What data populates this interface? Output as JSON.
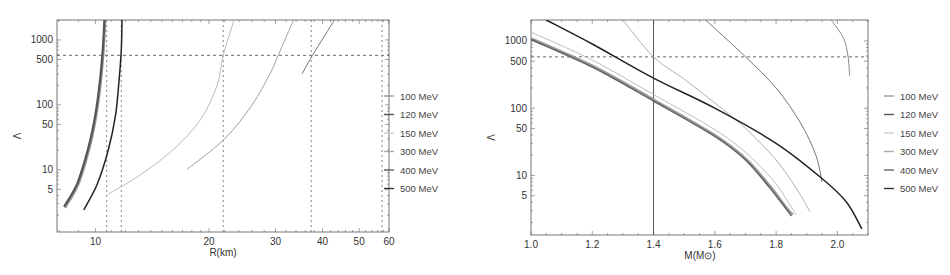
{
  "chart_data": [
    {
      "type": "line",
      "title": "",
      "xlabel": "R(km)",
      "ylabel": "Λ",
      "xscale": "log",
      "yscale": "log",
      "xlim": [
        7.9,
        60
      ],
      "ylim": [
        1.1,
        2030
      ],
      "xticks": [
        10,
        20,
        30,
        40,
        50,
        60
      ],
      "yticks": [
        5,
        10,
        50,
        100,
        500,
        1000
      ],
      "grid": false,
      "legend_position": "right",
      "reference_lines": {
        "horizontal": [
          {
            "y": 580,
            "style": "dashed"
          }
        ],
        "vertical": [
          {
            "x": 10.7,
            "style": "dotted"
          },
          {
            "x": 11.7,
            "style": "dotted"
          },
          {
            "x": 21.8,
            "style": "dotted"
          },
          {
            "x": 37.3,
            "style": "dotted"
          },
          {
            "x": 57.5,
            "style": "dotted"
          }
        ]
      },
      "series": [
        {
          "name": "100 MeV",
          "color": "#9a9a9a",
          "width": 2.4,
          "points": [
            [
              8.3,
              2.6
            ],
            [
              9.0,
              6
            ],
            [
              9.6,
              20
            ],
            [
              10.0,
              60
            ],
            [
              10.3,
              200
            ],
            [
              10.5,
              700
            ],
            [
              10.6,
              2030
            ]
          ]
        },
        {
          "name": "120 MeV",
          "color": "#555555",
          "width": 2.2,
          "points": [
            [
              8.25,
              2.7
            ],
            [
              8.95,
              6.2
            ],
            [
              9.55,
              21
            ],
            [
              9.95,
              62
            ],
            [
              10.25,
              210
            ],
            [
              10.45,
              720
            ],
            [
              10.55,
              2030
            ]
          ]
        },
        {
          "name": "150 MeV",
          "color": "#bbbbbb",
          "width": 1.0,
          "points": [
            [
              10.8,
              4.2
            ],
            [
              13,
              8
            ],
            [
              16,
              20
            ],
            [
              19,
              60
            ],
            [
              21,
              200
            ],
            [
              21.8,
              580
            ],
            [
              23.3,
              2030
            ]
          ]
        },
        {
          "name": "300 MeV",
          "color": "#a0a0a0",
          "width": 1.0,
          "points": [
            [
              17.5,
              10.2
            ],
            [
              22,
              30
            ],
            [
              26,
              100
            ],
            [
              29,
              300
            ],
            [
              30.5,
              580
            ],
            [
              33.5,
              2030
            ]
          ]
        },
        {
          "name": "400 MeV",
          "color": "#777777",
          "width": 1.0,
          "points": [
            [
              35.3,
              300
            ],
            [
              37.6,
              580
            ],
            [
              43,
              2030
            ]
          ]
        },
        {
          "name": "500 MeV",
          "color": "#222222",
          "width": 1.5,
          "points": [
            [
              9.3,
              2.4
            ],
            [
              10.1,
              6
            ],
            [
              10.8,
              20
            ],
            [
              11.3,
              70
            ],
            [
              11.55,
              250
            ],
            [
              11.7,
              700
            ],
            [
              11.75,
              2030
            ]
          ]
        }
      ]
    },
    {
      "type": "line",
      "title": "",
      "xlabel": "M(M⊙)",
      "ylabel": "Λ",
      "xscale": "linear",
      "yscale": "log",
      "xlim": [
        1.0,
        2.1
      ],
      "ylim": [
        1.3,
        2050
      ],
      "xticks": [
        1.0,
        1.2,
        1.4,
        1.6,
        1.8,
        2.0
      ],
      "yticks": [
        5,
        10,
        50,
        100,
        500,
        1000
      ],
      "grid": false,
      "legend_position": "right",
      "reference_lines": {
        "horizontal": [
          {
            "y": 580,
            "style": "dashed"
          }
        ],
        "vertical": [
          {
            "x": 1.4,
            "style": "solid"
          }
        ]
      },
      "series": [
        {
          "name": "100 MeV",
          "color": "#9a9a9a",
          "width": 2.2,
          "points": [
            [
              1.0,
              1100
            ],
            [
              1.2,
              430
            ],
            [
              1.4,
              135
            ],
            [
              1.6,
              40
            ],
            [
              1.7,
              18
            ],
            [
              1.78,
              7
            ],
            [
              1.83,
              3.5
            ],
            [
              1.855,
              2.6
            ]
          ]
        },
        {
          "name": "120 MeV",
          "color": "#666666",
          "width": 1.6,
          "points": [
            [
              1.0,
              1050
            ],
            [
              1.2,
              410
            ],
            [
              1.4,
              128
            ],
            [
              1.6,
              38
            ],
            [
              1.7,
              17
            ],
            [
              1.78,
              6.5
            ],
            [
              1.83,
              3.3
            ],
            [
              1.85,
              2.5
            ]
          ]
        },
        {
          "name": "150 MeV",
          "color": "#bbbbbb",
          "width": 1.0,
          "points": [
            [
              1.0,
              1350
            ],
            [
              1.2,
              520
            ],
            [
              1.4,
              160
            ],
            [
              1.6,
              48
            ],
            [
              1.7,
              22
            ],
            [
              1.79,
              8.5
            ],
            [
              1.84,
              4
            ],
            [
              1.865,
              2.6
            ]
          ]
        },
        {
          "name": "300 MeV",
          "color": "#b0b0b0",
          "width": 1.0,
          "points": [
            [
              1.3,
              2050
            ],
            [
              1.4,
              580
            ],
            [
              1.5,
              270
            ],
            [
              1.6,
              120
            ],
            [
              1.7,
              50
            ],
            [
              1.8,
              17
            ],
            [
              1.87,
              6
            ],
            [
              1.91,
              2.9
            ]
          ]
        },
        {
          "name": "400 MeV",
          "color": "#777777",
          "width": 1.0,
          "points": [
            [
              1.57,
              2050
            ],
            [
              1.7,
              580
            ],
            [
              1.8,
              200
            ],
            [
              1.88,
              60
            ],
            [
              1.93,
              20
            ],
            [
              1.95,
              8
            ]
          ]
        },
        {
          "name": "500 MeV",
          "color": "#222222",
          "width": 1.5,
          "points": [
            [
              1.05,
              2050
            ],
            [
              1.2,
              900
            ],
            [
              1.4,
              280
            ],
            [
              1.6,
              100
            ],
            [
              1.8,
              30
            ],
            [
              1.95,
              9
            ],
            [
              2.03,
              4
            ],
            [
              2.08,
              1.6
            ]
          ]
        },
        {
          "name": "400 MeV (upper branch)",
          "color": "#888888",
          "width": 1.0,
          "points": [
            [
              1.98,
              2050
            ],
            [
              2.02,
              1100
            ],
            [
              2.035,
              580
            ],
            [
              2.04,
              300
            ]
          ]
        }
      ]
    }
  ],
  "legend": {
    "entries": [
      {
        "label": "100 MeV",
        "color": "#9a9a9a"
      },
      {
        "label": "120 MeV",
        "color": "#555555"
      },
      {
        "label": "150 MeV",
        "color": "#cccccc"
      },
      {
        "label": "300 MeV",
        "color": "#aaaaaa"
      },
      {
        "label": "400 MeV",
        "color": "#666666"
      },
      {
        "label": "500 MeV",
        "color": "#333333"
      }
    ]
  }
}
